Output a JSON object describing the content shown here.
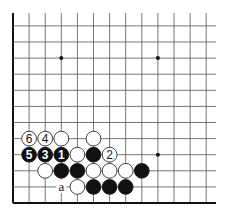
{
  "diagram": {
    "type": "go-board-corner",
    "board_size": 19,
    "visible_columns": 13,
    "visible_rows": 12,
    "edges": [
      "left",
      "bottom"
    ],
    "colors": {
      "black": "#111111",
      "white": "#ffffff",
      "line": "#555555",
      "edge": "#111111"
    },
    "star_points": [
      {
        "col": 3,
        "row": 9
      },
      {
        "col": 9,
        "row": 9
      },
      {
        "col": 9,
        "row": 3
      }
    ],
    "stones": [
      {
        "color": "white",
        "col": 1,
        "row": 4,
        "label": "6"
      },
      {
        "color": "white",
        "col": 2,
        "row": 4,
        "label": "4"
      },
      {
        "color": "white",
        "col": 3,
        "row": 4,
        "label": ""
      },
      {
        "color": "white",
        "col": 5,
        "row": 4,
        "label": ""
      },
      {
        "color": "black",
        "col": 1,
        "row": 3,
        "label": "5"
      },
      {
        "color": "black",
        "col": 2,
        "row": 3,
        "label": "3"
      },
      {
        "color": "black",
        "col": 3,
        "row": 3,
        "label": "1"
      },
      {
        "color": "white",
        "col": 4,
        "row": 3,
        "label": ""
      },
      {
        "color": "black",
        "col": 5,
        "row": 3,
        "label": ""
      },
      {
        "color": "white",
        "col": 6,
        "row": 3,
        "label": "2"
      },
      {
        "color": "white",
        "col": 2,
        "row": 2,
        "label": ""
      },
      {
        "color": "black",
        "col": 3,
        "row": 2,
        "label": ""
      },
      {
        "color": "black",
        "col": 4,
        "row": 2,
        "label": ""
      },
      {
        "color": "white",
        "col": 5,
        "row": 2,
        "label": ""
      },
      {
        "color": "white",
        "col": 6,
        "row": 2,
        "label": ""
      },
      {
        "color": "white",
        "col": 7,
        "row": 2,
        "label": ""
      },
      {
        "color": "black",
        "col": 8,
        "row": 2,
        "label": ""
      },
      {
        "color": "white",
        "col": 4,
        "row": 1,
        "label": ""
      },
      {
        "color": "black",
        "col": 5,
        "row": 1,
        "label": ""
      },
      {
        "color": "black",
        "col": 6,
        "row": 1,
        "label": ""
      },
      {
        "color": "black",
        "col": 7,
        "row": 1,
        "label": ""
      }
    ],
    "markers": [
      {
        "col": 3,
        "row": 1,
        "label": "a"
      }
    ]
  }
}
